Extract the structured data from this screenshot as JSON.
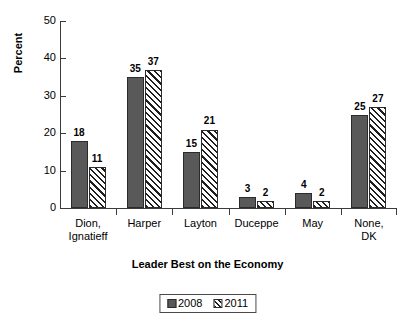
{
  "chart_data": {
    "type": "bar",
    "title": "",
    "xlabel": "Leader Best on the Economy",
    "ylabel": "Percent",
    "categories": [
      "Dion, Ignatieff",
      "Harper",
      "Layton",
      "Duceppe",
      "May",
      "None, DK"
    ],
    "category_lines": [
      [
        "Dion,",
        "Ignatieff"
      ],
      [
        "Harper"
      ],
      [
        "Layton"
      ],
      [
        "Duceppe"
      ],
      [
        "May"
      ],
      [
        "None,",
        "DK"
      ]
    ],
    "series": [
      {
        "name": "2008",
        "values": [
          18,
          35,
          15,
          3,
          4,
          25
        ],
        "fill": "solid",
        "color": "#595959"
      },
      {
        "name": "2011",
        "values": [
          11,
          37,
          21,
          2,
          2,
          27
        ],
        "fill": "hatched",
        "color": "#ffffff"
      }
    ],
    "ylim": [
      0,
      50
    ],
    "yticks": [
      0,
      10,
      20,
      30,
      40,
      50
    ],
    "ytick_labels": [
      "0",
      "10",
      "20",
      "30",
      "40",
      "50"
    ],
    "grid": false,
    "legend_position": "bottom-center",
    "legend_entries": [
      "2008",
      "2011"
    ],
    "data_labels": true
  }
}
